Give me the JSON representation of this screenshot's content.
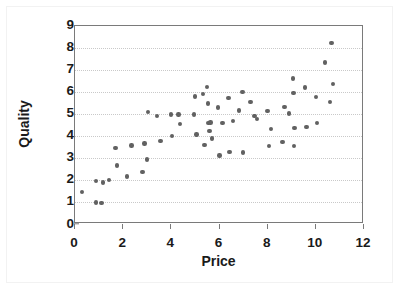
{
  "figure": {
    "background_color": "#ffffff",
    "marker_color": "#616161",
    "axis_color": "#7a7a7a",
    "grid_color": "#c9c9c9"
  },
  "chart_data": {
    "type": "scatter",
    "title": "",
    "xlabel": "Price",
    "ylabel": "Quality",
    "xlim": [
      0,
      12
    ],
    "ylim": [
      0,
      9
    ],
    "xticks": [
      0,
      2,
      4,
      6,
      8,
      10,
      12
    ],
    "yticks": [
      0,
      1,
      2,
      3,
      4,
      5,
      6,
      7,
      8,
      9
    ],
    "xtick_labels": [
      "0",
      "2",
      "4",
      "6",
      "8",
      "10",
      "12"
    ],
    "ytick_labels": [
      "0",
      "1",
      "2",
      "3",
      "4",
      "5",
      "6",
      "7",
      "8",
      "9"
    ],
    "grid": "horizontal-dotted",
    "legend": "none",
    "series": [
      {
        "name": "Price vs Quality",
        "marker": "diamond",
        "color": "#616161",
        "points": [
          [
            0.29,
            1.47
          ],
          [
            0.86,
            1.0
          ],
          [
            1.1,
            0.97
          ],
          [
            0.88,
            1.98
          ],
          [
            1.15,
            1.9
          ],
          [
            1.42,
            2.0
          ],
          [
            1.68,
            3.45
          ],
          [
            1.75,
            2.67
          ],
          [
            2.15,
            2.17
          ],
          [
            2.35,
            3.57
          ],
          [
            2.8,
            2.37
          ],
          [
            2.88,
            3.66
          ],
          [
            2.98,
            2.95
          ],
          [
            3.02,
            5.1
          ],
          [
            3.4,
            4.9
          ],
          [
            3.55,
            3.77
          ],
          [
            3.98,
            4.98
          ],
          [
            4.02,
            4.0
          ],
          [
            4.3,
            4.97
          ],
          [
            4.35,
            4.55
          ],
          [
            4.95,
            4.98
          ],
          [
            4.98,
            5.8
          ],
          [
            5.05,
            4.08
          ],
          [
            5.32,
            5.9
          ],
          [
            5.38,
            3.6
          ],
          [
            5.48,
            6.22
          ],
          [
            5.52,
            5.48
          ],
          [
            5.55,
            4.6
          ],
          [
            5.58,
            4.22
          ],
          [
            5.62,
            4.62
          ],
          [
            5.7,
            3.9
          ],
          [
            5.95,
            5.3
          ],
          [
            6.0,
            3.12
          ],
          [
            6.12,
            4.6
          ],
          [
            6.38,
            5.72
          ],
          [
            6.42,
            3.27
          ],
          [
            6.55,
            4.67
          ],
          [
            6.8,
            5.15
          ],
          [
            6.95,
            6.0
          ],
          [
            6.98,
            3.25
          ],
          [
            7.28,
            5.53
          ],
          [
            7.45,
            4.92
          ],
          [
            7.55,
            4.78
          ],
          [
            8.0,
            5.13
          ],
          [
            8.05,
            3.55
          ],
          [
            8.15,
            4.32
          ],
          [
            8.62,
            3.72
          ],
          [
            8.7,
            5.32
          ],
          [
            8.88,
            5.02
          ],
          [
            9.05,
            6.6
          ],
          [
            9.08,
            5.95
          ],
          [
            9.1,
            3.55
          ],
          [
            9.12,
            4.37
          ],
          [
            9.55,
            6.2
          ],
          [
            9.62,
            4.4
          ],
          [
            10.0,
            5.78
          ],
          [
            10.05,
            4.6
          ],
          [
            10.38,
            7.33
          ],
          [
            10.6,
            5.55
          ],
          [
            10.65,
            8.2
          ],
          [
            10.72,
            6.35
          ]
        ]
      }
    ]
  }
}
